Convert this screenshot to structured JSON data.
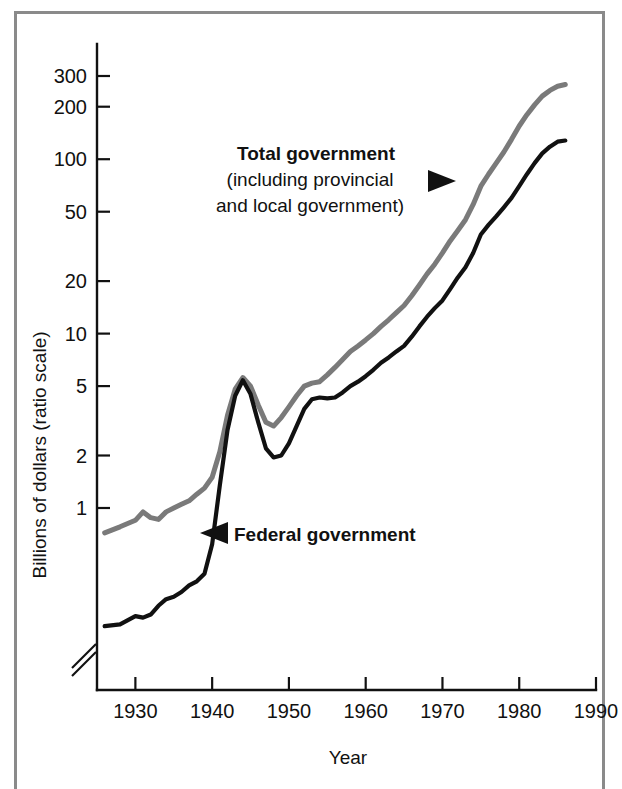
{
  "figure": {
    "background_color": "#ffffff",
    "frame_color": "#8a8a8a"
  },
  "chart_data": {
    "type": "line",
    "title": "",
    "subtitle": "",
    "xlabel": "Year",
    "ylabel": "Billions of dollars (ratio scale)",
    "scale": "log",
    "grid": false,
    "legend_position": "inline-annotations",
    "xlim": [
      1925,
      1990
    ],
    "ylim": [
      0.38,
      420
    ],
    "xticks": [
      1930,
      1940,
      1950,
      1960,
      1970,
      1980,
      1990
    ],
    "xticklabels": [
      "1930",
      "1940",
      "1950",
      "1960",
      "1970",
      "1980",
      "1990"
    ],
    "yticks": [
      1,
      2,
      5,
      10,
      20,
      50,
      100,
      200,
      300
    ],
    "yticklabels": [
      "1",
      "2",
      "5",
      "10",
      "20",
      "50",
      "100",
      "200",
      "300"
    ],
    "axis_break": true,
    "series": [
      {
        "name": "Total government",
        "color": "#7a7a7a",
        "width": 5.0,
        "x": [
          1926,
          1928,
          1930,
          1931,
          1932,
          1933,
          1934,
          1935,
          1936,
          1937,
          1938,
          1939,
          1940,
          1941,
          1942,
          1943,
          1944,
          1945,
          1946,
          1947,
          1948,
          1949,
          1950,
          1951,
          1952,
          1953,
          1954,
          1955,
          1956,
          1957,
          1958,
          1959,
          1960,
          1961,
          1962,
          1963,
          1964,
          1965,
          1966,
          1967,
          1968,
          1969,
          1970,
          1971,
          1972,
          1973,
          1974,
          1975,
          1976,
          1977,
          1978,
          1979,
          1980,
          1981,
          1982,
          1983,
          1984,
          1985,
          1986
        ],
        "y": [
          0.72,
          0.78,
          0.85,
          0.95,
          0.88,
          0.86,
          0.95,
          1.0,
          1.05,
          1.1,
          1.2,
          1.3,
          1.5,
          2.1,
          3.4,
          4.8,
          5.6,
          5.0,
          3.9,
          3.1,
          2.95,
          3.3,
          3.8,
          4.4,
          5.0,
          5.2,
          5.3,
          5.8,
          6.4,
          7.1,
          7.9,
          8.5,
          9.2,
          10.0,
          11.0,
          12.0,
          13.2,
          14.5,
          16.5,
          19.0,
          22.0,
          25.0,
          29.0,
          34.0,
          39.0,
          45.0,
          55.0,
          70.0,
          82.0,
          95.0,
          110.0,
          130.0,
          155.0,
          180.0,
          205.0,
          230.0,
          248.0,
          262.0,
          268.0
        ]
      },
      {
        "name": "Federal government",
        "color": "#111111",
        "width": 4.2,
        "x": [
          1926,
          1928,
          1930,
          1931,
          1932,
          1933,
          1934,
          1935,
          1936,
          1937,
          1938,
          1939,
          1940,
          1941,
          1942,
          1943,
          1944,
          1945,
          1946,
          1947,
          1948,
          1949,
          1950,
          1951,
          1952,
          1953,
          1954,
          1955,
          1956,
          1957,
          1958,
          1959,
          1960,
          1961,
          1962,
          1963,
          1964,
          1965,
          1966,
          1967,
          1968,
          1969,
          1970,
          1971,
          1972,
          1973,
          1974,
          1975,
          1976,
          1977,
          1978,
          1979,
          1980,
          1981,
          1982,
          1983,
          1984,
          1985,
          1986
        ],
        "y": [
          0.21,
          0.215,
          0.24,
          0.235,
          0.245,
          0.275,
          0.3,
          0.31,
          0.33,
          0.36,
          0.38,
          0.42,
          0.62,
          1.35,
          2.8,
          4.4,
          5.4,
          4.5,
          3.1,
          2.2,
          1.95,
          2.0,
          2.35,
          2.95,
          3.7,
          4.2,
          4.3,
          4.25,
          4.3,
          4.6,
          5.0,
          5.3,
          5.7,
          6.2,
          6.8,
          7.3,
          7.9,
          8.5,
          9.6,
          11.0,
          12.5,
          14.0,
          15.5,
          18.0,
          21.0,
          24.0,
          29.0,
          37.0,
          42.0,
          47.0,
          53.0,
          60.0,
          70.0,
          82.0,
          95.0,
          108.0,
          118.0,
          126.0,
          128.0
        ]
      }
    ],
    "annotations": [
      {
        "id": "total-government-label",
        "lines": [
          "Total government",
          "(including provincial",
          "and local government)"
        ],
        "bold_lines": [
          true,
          false,
          false
        ],
        "arrow": "right"
      },
      {
        "id": "federal-government-label",
        "lines": [
          "Federal government"
        ],
        "bold_lines": [
          true
        ],
        "arrow": "left"
      }
    ]
  },
  "labels": {
    "y_axis_title": "Billions of dollars (ratio scale)",
    "x_axis_title": "Year",
    "total_line1": "Total government",
    "total_line2": "(including provincial",
    "total_line3": "and local government)",
    "federal_label": "Federal government"
  }
}
